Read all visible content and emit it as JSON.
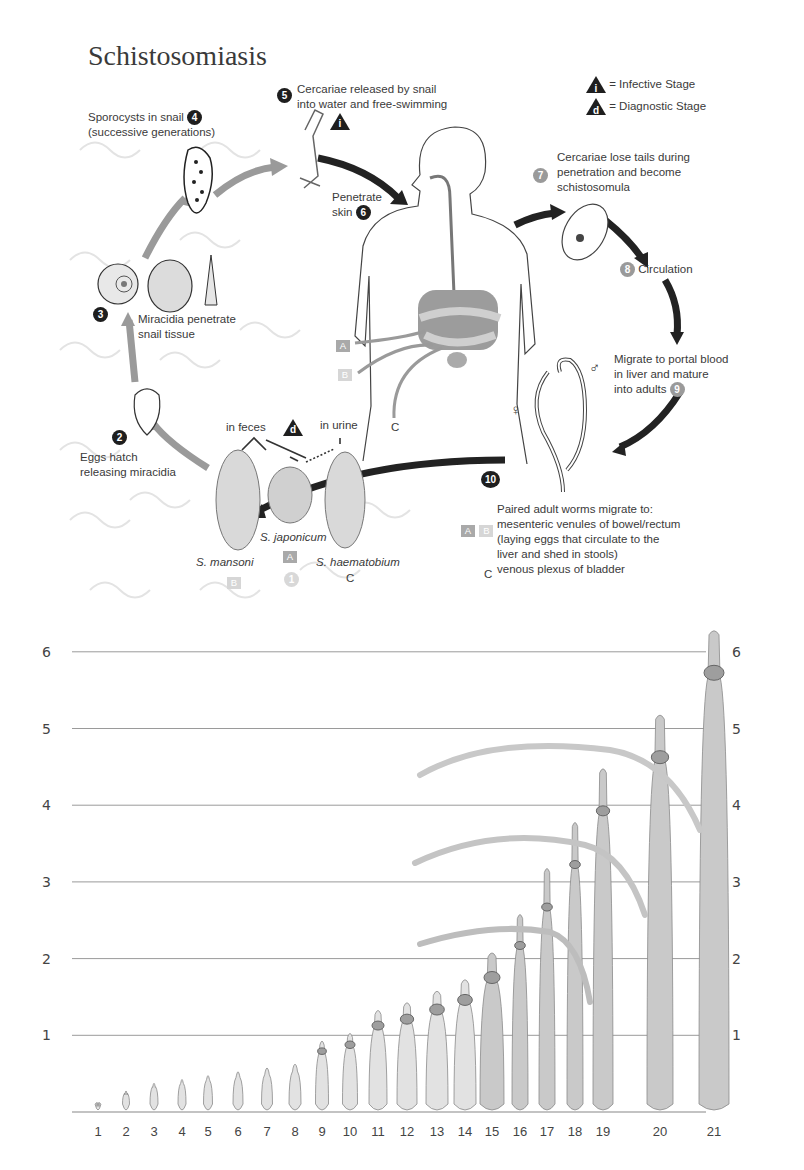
{
  "diagram": {
    "title": "Schistosomiasis",
    "legend": {
      "infective": {
        "symbol": "i",
        "label": "= Infective Stage"
      },
      "diagnostic": {
        "symbol": "d",
        "label": "= Diagnostic Stage"
      }
    },
    "steps": [
      {
        "n": "1",
        "label": ""
      },
      {
        "n": "2",
        "label_lines": [
          "Eggs hatch",
          "releasing miracidia"
        ]
      },
      {
        "n": "3",
        "label_lines": [
          "Miracidia penetrate",
          "snail tissue"
        ]
      },
      {
        "n": "4",
        "label_lines": [
          "Sporocysts in snail",
          "(successive generations)"
        ]
      },
      {
        "n": "5",
        "label_lines": [
          "Cercariae released by snail",
          "into water and free-swimming"
        ]
      },
      {
        "n": "6",
        "label_lines": [
          "Penetrate",
          "skin"
        ]
      },
      {
        "n": "7",
        "label_lines": [
          "Cercariae lose tails during",
          "penetration and become",
          "schistosomula"
        ]
      },
      {
        "n": "8",
        "label_lines": [
          "Circulation"
        ]
      },
      {
        "n": "9",
        "label_lines": [
          "Migrate to portal blood",
          "in liver and mature",
          "into adults"
        ]
      },
      {
        "n": "10",
        "label_lines": [
          "Paired adult worms migrate to:",
          "mesenteric venules of bowel/rectum",
          "(laying eggs that circulate to the",
          "liver and shed in stools)",
          "venous plexus of bladder"
        ]
      }
    ],
    "eggs": {
      "in_feces": "in feces",
      "in_urine": "in urine",
      "species": [
        {
          "name": "S. mansoni",
          "tag": "B"
        },
        {
          "name": "S. japonicum",
          "tag": "A"
        },
        {
          "name": "S. haematobium",
          "tag": "C"
        }
      ]
    },
    "body_tags": [
      "A",
      "B",
      "C"
    ],
    "step10_tags": {
      "ab": [
        "A",
        "B"
      ],
      "c": "C"
    },
    "sex_symbols": {
      "female": "♀",
      "male": "♂"
    }
  },
  "chart_data": {
    "type": "bar",
    "title": "",
    "xlabel": "",
    "ylabel": "",
    "categories": [
      "1",
      "2",
      "3",
      "4",
      "5",
      "6",
      "7",
      "8",
      "9",
      "10",
      "11",
      "12",
      "13",
      "14",
      "15",
      "16",
      "17",
      "18",
      "19",
      "20",
      "21"
    ],
    "values": [
      0.15,
      0.3,
      0.4,
      0.45,
      0.5,
      0.55,
      0.6,
      0.65,
      0.95,
      1.05,
      1.35,
      1.45,
      1.6,
      1.75,
      2.1,
      2.6,
      3.2,
      3.8,
      4.5,
      5.2,
      6.3
    ],
    "ylim": [
      0,
      6.5
    ],
    "yticks": [
      "1",
      "2",
      "3",
      "4",
      "5",
      "6"
    ],
    "grid": true,
    "legend": "none",
    "note": "Illustrated specimens of increasing length drawn against a 0-6 height scale, axis labels on both left and right sides"
  }
}
